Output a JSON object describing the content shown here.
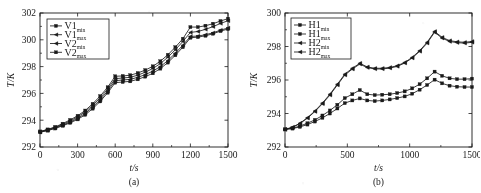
{
  "figure": {
    "background": "#ffffff",
    "ink": "#1a1a1a",
    "panel_count": 2
  },
  "chart_data": [
    {
      "id": "panel-a",
      "type": "line",
      "title": "",
      "caption": "(a)",
      "xlabel": "t/s",
      "ylabel": "T/K",
      "xlim": [
        0,
        1500
      ],
      "ylim": [
        292,
        302
      ],
      "xticks": [
        0,
        300,
        600,
        900,
        1200,
        1500
      ],
      "yticks": [
        292,
        294,
        296,
        298,
        300,
        302
      ],
      "xticklabels": [
        "0",
        "300",
        "600",
        "900",
        "1200",
        "1500"
      ],
      "yticklabels": [
        "292",
        "294",
        "296",
        "298",
        "300",
        "302"
      ],
      "grid": false,
      "legend_position": "upper-left",
      "legend": [
        {
          "base": "V1",
          "sub": "min",
          "marker": "square"
        },
        {
          "base": "V1",
          "sub": "max",
          "marker": "left-triangle"
        },
        {
          "base": "V2",
          "sub": "min",
          "marker": "left-triangle"
        },
        {
          "base": "V2",
          "sub": "max",
          "marker": "square"
        }
      ],
      "x": [
        0,
        60,
        120,
        180,
        240,
        300,
        360,
        420,
        480,
        540,
        600,
        660,
        720,
        780,
        840,
        900,
        960,
        1020,
        1080,
        1140,
        1200,
        1260,
        1320,
        1380,
        1440,
        1500
      ],
      "series": [
        {
          "name": "V1min",
          "marker": "square",
          "values": [
            293.1,
            293.22,
            293.38,
            293.58,
            293.8,
            294.06,
            294.4,
            294.86,
            295.4,
            296.05,
            296.8,
            296.85,
            296.9,
            297.05,
            297.25,
            297.5,
            297.85,
            298.3,
            298.85,
            299.45,
            300.15,
            300.2,
            300.3,
            300.45,
            300.65,
            300.8
          ]
        },
        {
          "name": "V1max",
          "marker": "left-triangle",
          "values": [
            293.12,
            293.25,
            293.42,
            293.62,
            293.86,
            294.14,
            294.5,
            294.98,
            295.52,
            296.18,
            296.95,
            297.0,
            297.05,
            297.2,
            297.4,
            297.66,
            298.0,
            298.45,
            299.0,
            299.6,
            300.25,
            300.28,
            300.38,
            300.52,
            300.72,
            300.88
          ]
        },
        {
          "name": "V2min",
          "marker": "left-triangle",
          "values": [
            293.14,
            293.28,
            293.46,
            293.68,
            293.94,
            294.24,
            294.62,
            295.1,
            295.66,
            296.32,
            297.1,
            297.15,
            297.2,
            297.36,
            297.58,
            297.86,
            298.22,
            298.7,
            299.26,
            299.88,
            300.55,
            300.62,
            300.78,
            300.98,
            301.22,
            301.42
          ]
        },
        {
          "name": "V2max",
          "marker": "square",
          "values": [
            293.16,
            293.31,
            293.5,
            293.74,
            294.02,
            294.33,
            294.72,
            295.22,
            295.8,
            296.46,
            297.28,
            297.3,
            297.36,
            297.52,
            297.74,
            298.02,
            298.4,
            298.88,
            299.45,
            300.08,
            300.95,
            300.95,
            301.05,
            301.2,
            301.4,
            301.58
          ]
        }
      ]
    },
    {
      "id": "panel-b",
      "type": "line",
      "title": "",
      "caption": "(b)",
      "xlabel": "t/s",
      "ylabel": "T/K",
      "xlim": [
        0,
        1500
      ],
      "ylim": [
        292,
        300
      ],
      "xticks": [
        0,
        500,
        1000,
        1500
      ],
      "yticks": [
        292,
        294,
        296,
        298,
        300
      ],
      "xticklabels": [
        "0",
        "500",
        "1000",
        "1500"
      ],
      "yticklabels": [
        "292",
        "294",
        "296",
        "298",
        "300"
      ],
      "grid": false,
      "legend_position": "upper-left",
      "legend": [
        {
          "base": "H1",
          "sub": "min",
          "marker": "square"
        },
        {
          "base": "H1",
          "sub": "max",
          "marker": "square"
        },
        {
          "base": "H2",
          "sub": "min",
          "marker": "left-triangle"
        },
        {
          "base": "H2",
          "sub": "max",
          "marker": "left-triangle"
        }
      ],
      "x": [
        0,
        60,
        120,
        180,
        240,
        300,
        360,
        420,
        480,
        540,
        600,
        660,
        720,
        780,
        840,
        900,
        960,
        1020,
        1080,
        1140,
        1200,
        1260,
        1320,
        1380,
        1440,
        1500
      ],
      "series": [
        {
          "name": "H1min",
          "marker": "square",
          "values": [
            293.05,
            293.12,
            293.25,
            293.42,
            293.62,
            293.88,
            294.18,
            294.52,
            294.92,
            295.15,
            295.4,
            295.15,
            295.1,
            295.12,
            295.15,
            295.22,
            295.32,
            295.5,
            295.75,
            296.1,
            296.5,
            296.25,
            296.1,
            296.05,
            296.05,
            296.08
          ]
        },
        {
          "name": "H1max",
          "marker": "square",
          "values": [
            293.05,
            293.1,
            293.2,
            293.34,
            293.52,
            293.74,
            294.0,
            294.3,
            294.62,
            294.78,
            294.9,
            294.78,
            294.74,
            294.78,
            294.84,
            294.92,
            295.02,
            295.18,
            295.42,
            295.7,
            296.02,
            295.8,
            295.66,
            295.6,
            295.58,
            295.58
          ]
        },
        {
          "name": "H2min",
          "marker": "left-triangle",
          "values": [
            293.05,
            293.18,
            293.42,
            293.75,
            294.15,
            294.62,
            295.15,
            295.75,
            296.35,
            296.7,
            297.0,
            296.78,
            296.7,
            296.7,
            296.75,
            296.85,
            297.05,
            297.35,
            297.75,
            298.25,
            298.9,
            298.55,
            298.35,
            298.28,
            298.25,
            298.3
          ]
        },
        {
          "name": "H2max",
          "marker": "left-triangle",
          "values": [
            293.05,
            293.17,
            293.4,
            293.72,
            294.12,
            294.58,
            295.1,
            295.7,
            296.3,
            296.65,
            296.95,
            296.74,
            296.66,
            296.66,
            296.71,
            296.81,
            297.01,
            297.31,
            297.71,
            298.2,
            298.85,
            298.5,
            298.3,
            298.23,
            298.2,
            298.25
          ]
        }
      ]
    }
  ]
}
